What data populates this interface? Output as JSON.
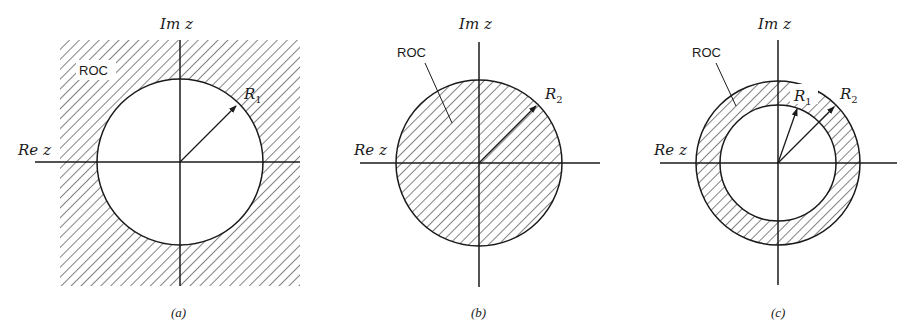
{
  "figure": {
    "panels": [
      {
        "id": "a",
        "caption": "(a)",
        "region_label": "ROC",
        "radius_labels": [
          {
            "main": "R",
            "sub": "1"
          }
        ],
        "axis_labels": {
          "imag": "Im z",
          "real": "Re z"
        },
        "description": "ROC is exterior of circle radius R1 (|z| > R1)"
      },
      {
        "id": "b",
        "caption": "(b)",
        "region_label": "ROC",
        "radius_labels": [
          {
            "main": "R",
            "sub": "2"
          }
        ],
        "axis_labels": {
          "imag": "Im z",
          "real": "Re z"
        },
        "description": "ROC is interior of circle radius R2 (|z| < R2)"
      },
      {
        "id": "c",
        "caption": "(c)",
        "region_label": "ROC",
        "radius_labels": [
          {
            "main": "R",
            "sub": "1"
          },
          {
            "main": "R",
            "sub": "2"
          }
        ],
        "axis_labels": {
          "imag": "Im z",
          "real": "Re z"
        },
        "description": "ROC is annulus R1 < |z| < R2"
      }
    ],
    "colors": {
      "ink": "#1a1a1a",
      "background": "#ffffff"
    }
  }
}
